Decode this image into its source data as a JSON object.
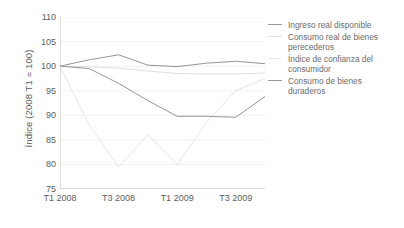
{
  "chart_data": {
    "type": "line",
    "title": "",
    "xlabel": "",
    "ylabel": "Índice (2008 T1 = 100)",
    "x": [
      "T1 2008",
      "T2 2008",
      "T3 2008",
      "T4 2008",
      "T1 2009",
      "T2 2009",
      "T3 2009",
      "T4 2009"
    ],
    "tick_labels": [
      "T1 2008",
      "T3 2008",
      "T1 2009",
      "T3 2009"
    ],
    "tick_label_positions": [
      0,
      2,
      4,
      6
    ],
    "ylim": [
      75,
      110
    ],
    "yticks": [
      75,
      80,
      85,
      90,
      95,
      100,
      105,
      110
    ],
    "grid": true,
    "legend_position": "right",
    "series": [
      {
        "name": "Ingreso real disponible",
        "color": "#8f8f8f",
        "style": "solid",
        "values": [
          100.0,
          101.3,
          102.3,
          100.2,
          99.9,
          100.6,
          101.0,
          100.5
        ]
      },
      {
        "name": "Consumo real de bienes perecederos",
        "color": "#dcdcdc",
        "style": "solid",
        "values": [
          100.0,
          99.9,
          99.6,
          99.0,
          98.5,
          98.4,
          98.4,
          98.6
        ]
      },
      {
        "name": "Índice de confianza del consumidor",
        "color": "#e6e6e6",
        "style": "solid",
        "values": [
          100.0,
          88.0,
          79.5,
          86.0,
          80.0,
          88.5,
          95.0,
          97.5
        ]
      },
      {
        "name": "Consumo de bienes duraderos",
        "color": "#8f8f8f",
        "style": "solid",
        "values": [
          100.0,
          99.5,
          96.5,
          93.0,
          89.8,
          89.8,
          89.6,
          93.8
        ]
      }
    ]
  },
  "legend": {
    "items": [
      {
        "label": "Ingreso real disponible"
      },
      {
        "label": "Consumo real de bienes perecederos"
      },
      {
        "label": "Índice de confianza del consumidor"
      },
      {
        "label": "Consumo de bienes duraderos"
      }
    ]
  }
}
